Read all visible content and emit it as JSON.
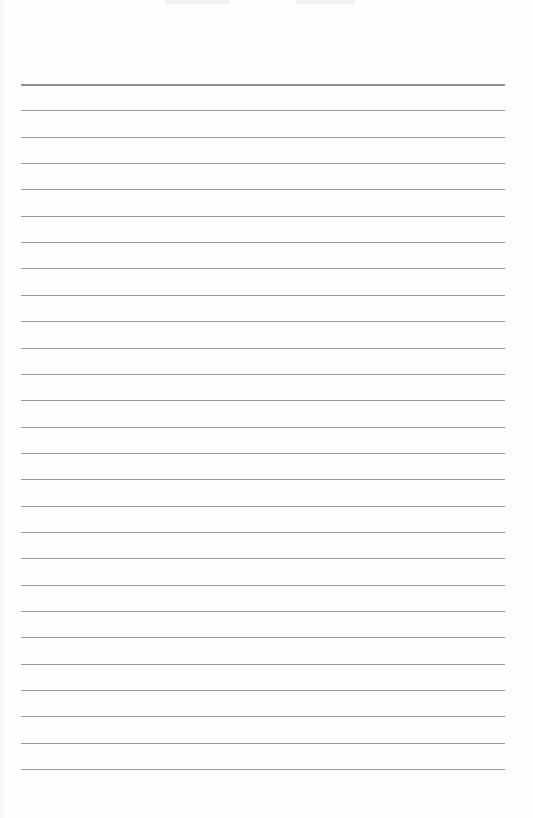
{
  "page": {
    "type": "lined-paper",
    "background": "#fefefe",
    "line_color": "#9a9a9a",
    "line_count": 27,
    "first_line_y": 84,
    "line_spacing": 26.35,
    "line_left": 21,
    "line_right": 505,
    "text": ""
  }
}
